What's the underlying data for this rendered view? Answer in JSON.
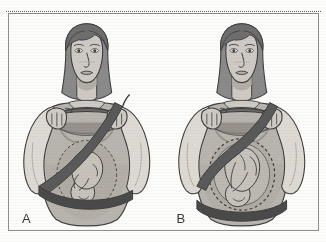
{
  "figure": {
    "kind": "two-panel medical illustration",
    "colors": {
      "paper": "#fdfdfc",
      "frame_line": "#8e8e8e",
      "perforation_line": "#5f5f5f",
      "outline": "#3f3f3f",
      "skin": "#cfcbc4",
      "skin_shadow": "#b3aea6",
      "hair": "#8a8a8a",
      "hair_dark": "#6e6e6e",
      "garment": "#b9b5ae",
      "garment_shadow": "#a09b94",
      "sleeve": "#dedad3",
      "belt": "#5a5a5a",
      "belt_dark": "#4a4a4a",
      "wheel": "#6a6a6a",
      "uterus": "#b0aba3",
      "fetus": "#c7c2ba",
      "label_text": "#3a3a3a"
    },
    "panels": [
      {
        "id": "A",
        "label": "A",
        "caption_semantics": "Incorrect seat belt placement",
        "lap_belt_position": "across the abdomen, over the uterus and fetus",
        "shoulder_belt_position": "from right shoulder diagonally across chest to left hip",
        "uterus_visible": true,
        "fetus_visible": true,
        "belt_crosses_uterus": true
      },
      {
        "id": "B",
        "label": "B",
        "caption_semantics": "Correct seat belt placement",
        "lap_belt_position": "low across the hips and pelvis, below the belly",
        "shoulder_belt_position": "from right shoulder between the breasts to the side of the belly",
        "uterus_visible": true,
        "fetus_visible": true,
        "belt_crosses_uterus": false
      }
    ],
    "shared_figure_elements": [
      "pregnant woman seated, front view",
      "shoulder-length dark parted hair",
      "both hands gripping steering wheel",
      "short-sleeve maternity garment",
      "steering wheel shown as dark ellipse",
      "uterus outlined with dashed line",
      "fetus in head-down vertex position"
    ]
  }
}
